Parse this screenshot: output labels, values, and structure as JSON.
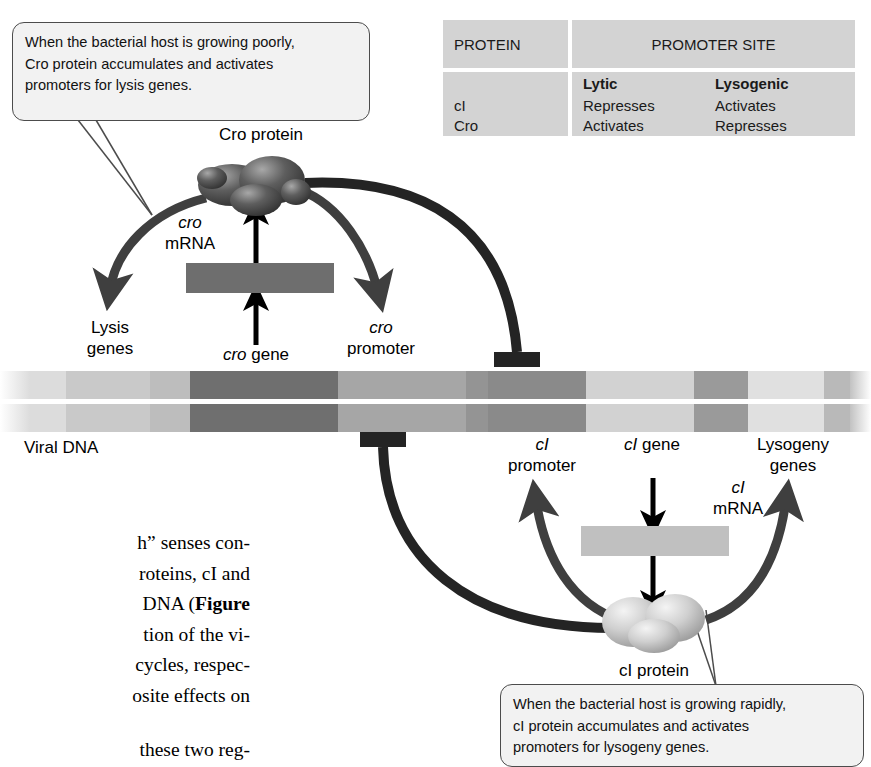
{
  "figure": {
    "name": "lambda-phage-genetic-switch",
    "viral_dna_label": "Viral DNA"
  },
  "callouts": {
    "cro": {
      "name": "cro-callout",
      "line1": "When the bacterial host is growing poorly,",
      "line2": "Cro protein accumulates and activates",
      "line3": "promoters for lysis genes."
    },
    "ci": {
      "name": "ci-callout",
      "line1": "When the bacterial host is growing rapidly,",
      "line2": "cI protein accumulates and activates",
      "line3": "promoters for lysogeny genes."
    }
  },
  "table": {
    "col1_header": "PROTEIN",
    "col2_header": "PROMOTER SITE",
    "sub_headers": [
      "Lytic",
      "Lysogenic"
    ],
    "rows": [
      {
        "protein": "cI",
        "lytic": "Represses",
        "lysogenic": "Activates"
      },
      {
        "protein": "Cro",
        "lytic": "Activates",
        "lysogenic": "Represses"
      }
    ]
  },
  "labels": {
    "cro_protein": "Cro protein",
    "cro_mrna_l1": "cro",
    "cro_mrna_l2": "mRNA",
    "lysis_l1": "Lysis",
    "lysis_l2": "genes",
    "cro_gene_it": "cro",
    "cro_gene_rest": " gene",
    "cro_promoter_l1": "cro",
    "cro_promoter_l2": "promoter",
    "ci_promoter_l1": "cI",
    "ci_promoter_l2": "promoter",
    "ci_gene_it": "cI",
    "ci_gene_rest": " gene",
    "ci_mrna_l1": "cI",
    "ci_mrna_l2": "mRNA",
    "lysogeny_l1": "Lysogeny",
    "lysogeny_l2": "genes",
    "ci_protein": "cI protein"
  },
  "body_text": {
    "line1": "h” senses con-",
    "line2": "roteins, cI and",
    "line3a": "DNA (",
    "line3b": "Figure",
    "line4": "tion of the vi-",
    "line5": "cycles, respec-",
    "line6": "osite effects on",
    "line7": "these two reg-"
  },
  "colors": {
    "callout_fill": "#f2f2f2",
    "callout_stroke": "#4c4c4c",
    "table_cell": "#d3d3d3",
    "cro_mrna_bar": "#6e6e6e",
    "ci_mrna_bar": "#c0c0c0",
    "thick_arrow": "#3f3f3f",
    "thick_arrow_dark": "#242424",
    "thin_arrow": "#000000",
    "cro_protein": "#4a4a4a",
    "ci_protein": "#c4c4c4"
  },
  "dna": {
    "name": "viral-dna-bar",
    "segments": [
      {
        "x": 0,
        "w": 22,
        "color": "#ffffff"
      },
      {
        "x": 22,
        "w": 44,
        "color": "#e3e3e3"
      },
      {
        "x": 66,
        "w": 84,
        "color": "#c9c9c9"
      },
      {
        "x": 150,
        "w": 40,
        "color": "#bdbdbd"
      },
      {
        "x": 190,
        "w": 148,
        "color": "#6f6f6f"
      },
      {
        "x": 338,
        "w": 128,
        "color": "#a6a6a6"
      },
      {
        "x": 466,
        "w": 22,
        "color": "#8f8f8f"
      },
      {
        "x": 488,
        "w": 98,
        "color": "#8a8a8a"
      },
      {
        "x": 586,
        "w": 108,
        "color": "#d2d2d2"
      },
      {
        "x": 694,
        "w": 54,
        "color": "#9a9a9a"
      },
      {
        "x": 748,
        "w": 76,
        "color": "#e0e0e0"
      },
      {
        "x": 824,
        "w": 28,
        "color": "#b9b9b9"
      },
      {
        "x": 852,
        "w": 19,
        "color": "#ffffff"
      }
    ]
  }
}
